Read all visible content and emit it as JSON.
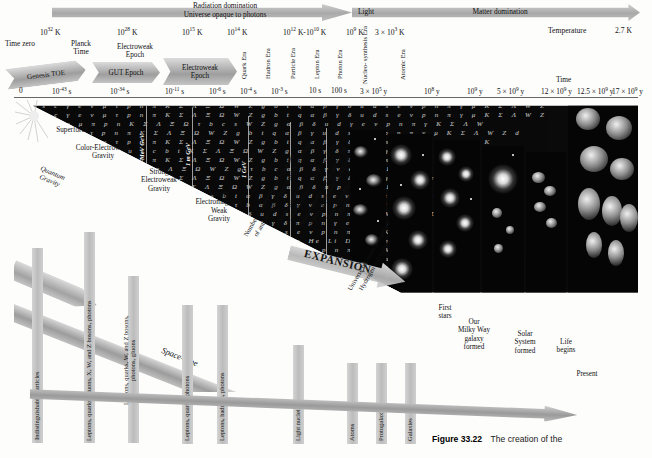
{
  "figure": {
    "number": "Figure 33.22",
    "caption": "The creation of the"
  },
  "banner": {
    "radiation": "Radiation domination\nUniverse opaque to photons",
    "radiation_line1": "Radiation domination",
    "radiation_line2": "Universe opaque to photons",
    "light": "Light",
    "matter": "Matter domination"
  },
  "temperature_axis": {
    "label": "Temperature",
    "final_value": "2.7 K",
    "ticks": [
      {
        "value": "10",
        "exp": "32",
        "unit": "K",
        "x": 70
      },
      {
        "value": "10",
        "exp": "28",
        "unit": "K",
        "x": 147
      },
      {
        "value": "10",
        "exp": "15",
        "unit": "K",
        "x": 205
      },
      {
        "value": "10",
        "exp": "14",
        "unit": "K",
        "x": 247
      },
      {
        "value": "10",
        "exp": "12",
        "unit": "K-10",
        "exp2": "10",
        "unit2": "K",
        "x": 296
      },
      {
        "value": "10",
        "exp": "9",
        "unit": "K",
        "x": 355
      },
      {
        "value": "3 × 10",
        "exp": "3",
        "unit": "K",
        "x": 387
      }
    ]
  },
  "time_axis": {
    "label": "Time",
    "time_zero": "Time zero",
    "planck_time": "Planck\nTime",
    "planck_time_l1": "Planck",
    "planck_time_l2": "Time",
    "ticks": [
      {
        "text": "0",
        "x": 21
      },
      {
        "text": "10",
        "exp": "-43",
        "unit": " s",
        "x": 63
      },
      {
        "text": "10",
        "exp": "-34",
        "unit": " s",
        "x": 121
      },
      {
        "text": "10",
        "exp": "-11",
        "unit": " s",
        "x": 175
      },
      {
        "text": "10",
        "exp": "-6",
        "unit": " s",
        "x": 219
      },
      {
        "text": "10",
        "exp": "-4",
        "unit": " s",
        "x": 252
      },
      {
        "text": "10",
        "exp": "-3",
        "unit": " s",
        "x": 283
      },
      {
        "text": "10 s",
        "x": 320
      },
      {
        "text": "100 s",
        "x": 342
      },
      {
        "text": "3 × 10",
        "exp": "5",
        "unit": " y",
        "x": 376
      },
      {
        "text": "10",
        "exp": "8",
        "unit": " y",
        "x": 434
      },
      {
        "text": "10",
        "exp": "9",
        "unit": " y",
        "x": 479
      },
      {
        "text": "5 × 10",
        "exp": "9",
        "unit": " y",
        "x": 511
      },
      {
        "text": "12 × 10",
        "exp": "9",
        "unit": " y",
        "x": 556
      },
      {
        "text": "12.5 × 10",
        "exp": "9",
        "unit": " y",
        "x": 591
      },
      {
        "text": "17 × 10",
        "exp": "9",
        "unit": " y",
        "x": 611
      }
    ]
  },
  "epochs": [
    {
      "label": "Genesis TOE",
      "x": 6,
      "w": 78
    },
    {
      "label": "GUT Epoch",
      "x": 88,
      "w": 72
    },
    {
      "label": "Electroweak\nEpoch",
      "l1": "Electroweak",
      "l2": "Epoch",
      "x": 163,
      "w": 72
    }
  ],
  "eras": [
    {
      "l1": "Quark",
      "l2": "Era",
      "x": 198
    },
    {
      "l1": "Hadron",
      "l2": "Era",
      "x": 228
    },
    {
      "l1": "Particle",
      "l2": "Era",
      "x": 262
    },
    {
      "l1": "Lepton",
      "l2": "Era",
      "x": 293
    },
    {
      "l1": "Photon",
      "l2": "Era",
      "x": 318
    },
    {
      "l1": "Nucleo-",
      "l2": "synthesis",
      "l3": "Era",
      "x": 356
    },
    {
      "l1": "Atomic",
      "l2": "Era",
      "x": 399
    }
  ],
  "forces": [
    {
      "text": "Superforce",
      "x": 26,
      "y": 126
    },
    {
      "text": "Color-Electroweak\nGravity",
      "l1": "Color-Electroweak",
      "l2": "Gravity",
      "x": 48,
      "y": 146
    },
    {
      "text": "Strong\nElectroweak\nGravity",
      "l1": "Strong",
      "l2": "Electroweak",
      "l3": "Gravity",
      "x": 125,
      "y": 168
    },
    {
      "text": "Strong\nElectromagnetic\nWeak\nGravity",
      "l1": "Strong",
      "l2": "Electromagnetic",
      "l3": "Weak",
      "l4": "Gravity",
      "x": 180,
      "y": 192
    },
    {
      "text": "Quantum\nGravity",
      "l1": "Quantum",
      "l2": "Gravity",
      "x": 6,
      "y": 163
    }
  ],
  "spacetime_label": "Space-time",
  "expansion_label": "EXPANSION",
  "energy_scales": [
    "10^4 GeV",
    "10^2 GeV",
    "1 GeV"
  ],
  "energy_scale_labels": [
    "MeV GeV",
    "1 m GeV",
    "1 GeV"
  ],
  "columns": [
    {
      "label": "Indistinguishable particles",
      "x": 32,
      "top": 248,
      "h": 195
    },
    {
      "label": "Leptons, quarks, gluons, X, W, and Z bosons, photons",
      "x": 84,
      "top": 232,
      "h": 212
    },
    {
      "label": "Leptons, quarks, W, and Z bosons,\nphotons, gluons",
      "l1": "Leptons, quarks, W, and Z bosons,",
      "l2": "photons, gluons",
      "x": 128,
      "top": 276,
      "h": 168
    },
    {
      "label": "Leptons, quarks, photons",
      "x": 182,
      "top": 305,
      "h": 140
    },
    {
      "label": "Leptons, hadrons, photons",
      "x": 217,
      "top": 305,
      "h": 140
    },
    {
      "label": "Light nuclei",
      "x": 293,
      "top": 345,
      "h": 100
    },
    {
      "label": "Atoms",
      "x": 347,
      "top": 363,
      "h": 82
    },
    {
      "label": "Protogalaxies",
      "x": 376,
      "top": 363,
      "h": 82
    },
    {
      "label": "Galaxies",
      "x": 405,
      "top": 363,
      "h": 82
    }
  ],
  "physics_notes": [
    "Number of nucleons equals number",
    "of antinucleons equals number of photons",
    "Neutron:proton 1:1",
    "= equal numbers of γ, e⁻, νₑ, μ, νμ",
    "Neutron:proton 1:5   1 p per 4 × 10⁸ γ",
    "density of photons 100 kg/cm³",
    "Neutron:proton 1:7",
    "Plasma",
    "Universe becomes transparent",
    "Hydrogen and helium"
  ],
  "events": [
    {
      "l1": "First",
      "l2": "stars",
      "x": 437,
      "y": 308
    },
    {
      "l1": "Our",
      "l2": "Milky Way",
      "l3": "galaxy",
      "l4": "formed",
      "x": 462,
      "y": 322
    },
    {
      "l1": "Solar",
      "l2": "System",
      "l3": "formed",
      "x": 519,
      "y": 332
    },
    {
      "l1": "Life",
      "l2": "begins",
      "x": 565,
      "y": 340
    },
    {
      "l1": "Present",
      "x": 578,
      "y": 370
    }
  ]
}
